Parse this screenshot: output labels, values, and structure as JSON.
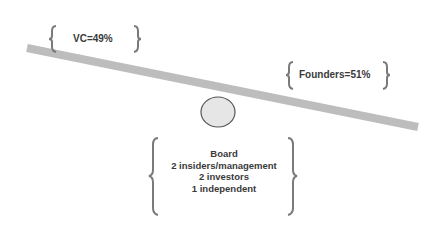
{
  "diagram": {
    "vc": {
      "label": "VC=49%"
    },
    "founders": {
      "label": "Founders=51%"
    },
    "board": {
      "lines": [
        "Board",
        "2 insiders/management",
        "2 investors",
        "1 independent"
      ]
    },
    "colors": {
      "beam": "#bdbdbd",
      "fulcrum_fill": "#e6e6e6",
      "fulcrum_stroke": "#555555",
      "brace": "#7a7a7a",
      "text": "#3a3a3a"
    }
  }
}
